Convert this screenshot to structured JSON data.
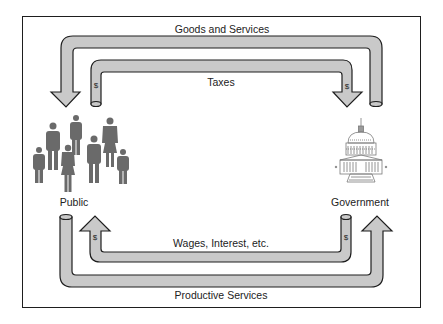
{
  "flows": {
    "goods_services": "Goods and Services",
    "taxes": "Taxes",
    "wages": "Wages, Interest, etc.",
    "productive": "Productive Services"
  },
  "nodes": {
    "public": "Public",
    "government": "Government"
  },
  "symbols": {
    "money": "$"
  },
  "colors": {
    "pipe_fill": "#c9c9c9",
    "pipe_stroke": "#1e1e1e",
    "figure": "#6a6a6a"
  }
}
